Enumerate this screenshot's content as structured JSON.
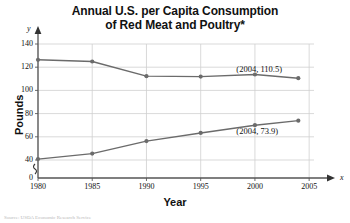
{
  "chart_data": {
    "type": "line",
    "title": "Annual U.S. per Capita Consumption of Red Meat and Poultry*",
    "title_line1": "Annual U.S. per Capita Consumption",
    "title_line2": "of Red Meat and Poultry*",
    "xlabel": "Year",
    "ylabel": "Pounds",
    "x_axis_name": "x",
    "y_axis_name": "y",
    "xlim": [
      1980,
      2006
    ],
    "ylim": [
      0,
      145
    ],
    "y_axis_break": true,
    "grid": true,
    "legend": "none",
    "x": [
      1980,
      1985,
      1990,
      1995,
      2000,
      2004
    ],
    "xticks": [
      "1980",
      "1985",
      "1990",
      "1995",
      "2000",
      "2005"
    ],
    "xtick_values": [
      1980,
      1985,
      1990,
      1995,
      2000,
      2005
    ],
    "yticks": [
      "0",
      "40",
      "60",
      "80",
      "100",
      "120",
      "140"
    ],
    "ytick_values": [
      0,
      40,
      60,
      80,
      100,
      120,
      140
    ],
    "series": [
      {
        "name": "Red Meat",
        "color": "#6b6b6b",
        "values": [
          126.4,
          124.9,
          112.3,
          111.9,
          113.7,
          110.5
        ]
      },
      {
        "name": "Poultry",
        "color": "#6b6b6b",
        "values": [
          40.8,
          45.5,
          56.3,
          63.3,
          70.0,
          73.9
        ]
      }
    ],
    "annotations": [
      {
        "label": "(2004, 110.5)",
        "x": 2004,
        "y": 110.5,
        "series": "Red Meat"
      },
      {
        "label": "(2004, 73.9)",
        "x": 2004,
        "y": 73.9,
        "series": "Poultry"
      }
    ],
    "footnote": "Source: USDA Economic Research Service"
  }
}
